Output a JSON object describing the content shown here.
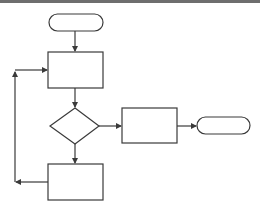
{
  "diagram": {
    "type": "flowchart",
    "colors": {
      "stroke": "#3a3a3a",
      "fill": "#ffffff",
      "topbar": "#6e6e6e"
    },
    "nodes": [
      {
        "id": "start",
        "shape": "terminal",
        "label": ""
      },
      {
        "id": "process1",
        "shape": "process",
        "label": ""
      },
      {
        "id": "decision",
        "shape": "decision",
        "label": ""
      },
      {
        "id": "process2",
        "shape": "process",
        "label": ""
      },
      {
        "id": "end",
        "shape": "terminal",
        "label": ""
      },
      {
        "id": "process3",
        "shape": "process",
        "label": ""
      }
    ],
    "edges": [
      {
        "from": "start",
        "to": "process1"
      },
      {
        "from": "process1",
        "to": "decision"
      },
      {
        "from": "decision",
        "to": "process2"
      },
      {
        "from": "process2",
        "to": "end"
      },
      {
        "from": "decision",
        "to": "process3"
      },
      {
        "from": "process3",
        "to": "process1",
        "kind": "loop-back"
      }
    ]
  }
}
